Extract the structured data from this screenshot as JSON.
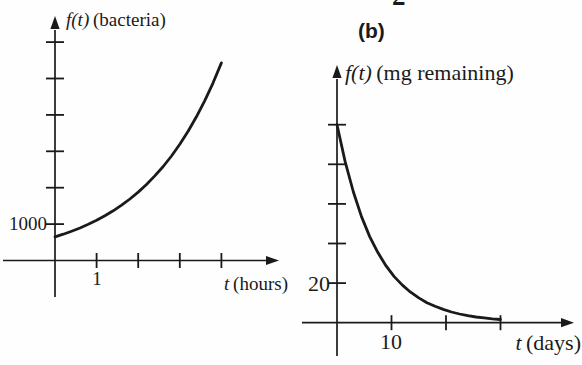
{
  "page": {
    "background": "#fefefe",
    "ink_color": "#1a1a1a",
    "partial_glyph": "2"
  },
  "chart_data": [
    {
      "id": "a",
      "type": "line",
      "ylabel_var": "f(t)",
      "ylabel_unit": "(bacteria)",
      "xlabel_var": "t",
      "xlabel_unit": "(hours)",
      "x_ticks": [
        1,
        2,
        3,
        4
      ],
      "x_tick_labels": [
        "1",
        "",
        "",
        ""
      ],
      "y_ticks": [
        1000,
        2000,
        3000,
        4000,
        5000,
        6000
      ],
      "y_tick_labels": [
        "1000",
        "",
        "",
        "",
        "",
        ""
      ],
      "xlim": [
        -1.25,
        5.4
      ],
      "ylim": [
        -1000,
        6700
      ],
      "grid": false,
      "series": [
        {
          "name": "bacteria-growth-curve",
          "points": [
            [
              0,
              650
            ],
            [
              0.2,
              723
            ],
            [
              0.4,
              804
            ],
            [
              0.6,
              894
            ],
            [
              0.8,
              994
            ],
            [
              1,
              1105
            ],
            [
              1.2,
              1229
            ],
            [
              1.4,
              1366
            ],
            [
              1.6,
              1519
            ],
            [
              1.8,
              1689
            ],
            [
              2,
              1879
            ],
            [
              2.2,
              2089
            ],
            [
              2.4,
              2323
            ],
            [
              2.6,
              2583
            ],
            [
              2.8,
              2872
            ],
            [
              3,
              3193
            ],
            [
              3.2,
              3551
            ],
            [
              3.4,
              3948
            ],
            [
              3.6,
              4390
            ],
            [
              3.8,
              4882
            ],
            [
              4,
              5429
            ]
          ]
        }
      ]
    },
    {
      "id": "b",
      "type": "line",
      "panel_label": "(b)",
      "ylabel_var": "f(t)",
      "ylabel_unit": "(mg remaining)",
      "xlabel_var": "t",
      "xlabel_unit": "(days)",
      "x_ticks": [
        10,
        20,
        30
      ],
      "x_tick_labels": [
        "10",
        "",
        ""
      ],
      "y_ticks": [
        20,
        40,
        60,
        80,
        100
      ],
      "y_tick_labels": [
        "20",
        "",
        "",
        "",
        ""
      ],
      "xlim": [
        -6.4,
        43.5
      ],
      "ylim": [
        -17,
        130
      ],
      "grid": false,
      "series": [
        {
          "name": "decay-curve",
          "points": [
            [
              0,
              100
            ],
            [
              1.5,
              81.2
            ],
            [
              3,
              66
            ],
            [
              4.5,
              53.6
            ],
            [
              6,
              43.5
            ],
            [
              7.5,
              35.4
            ],
            [
              9,
              28.7
            ],
            [
              10.5,
              23.3
            ],
            [
              12,
              19
            ],
            [
              13.5,
              15.4
            ],
            [
              15,
              12.5
            ],
            [
              16.5,
              10.1
            ],
            [
              18,
              8.3
            ],
            [
              19.5,
              6.7
            ],
            [
              21,
              5.4
            ],
            [
              22.5,
              4.4
            ],
            [
              24,
              3.6
            ],
            [
              25.5,
              2.9
            ],
            [
              27,
              2.4
            ],
            [
              28.5,
              1.9
            ],
            [
              30,
              1.6
            ]
          ]
        }
      ]
    }
  ]
}
